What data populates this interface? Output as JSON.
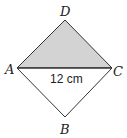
{
  "diagram": {
    "type": "square-with-diagonal",
    "vertices": {
      "D": {
        "label": "D",
        "x": 65,
        "y": 20
      },
      "A": {
        "label": "A",
        "x": 17,
        "y": 68
      },
      "C": {
        "label": "C",
        "x": 112,
        "y": 68
      },
      "B": {
        "label": "B",
        "x": 65,
        "y": 117
      }
    },
    "shaded_region": "triangle ADC",
    "shade_color": "#d3d3d3",
    "stroke_color": "#333333",
    "diagonal": {
      "from": "A",
      "to": "C",
      "label": "12 cm"
    }
  }
}
